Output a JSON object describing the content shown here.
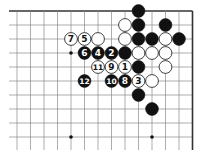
{
  "board": {
    "cols": 14,
    "rows": 10,
    "origin_x": 17,
    "origin_y": 11,
    "spacing_x": 13.5,
    "spacing_y": 14,
    "left_stub": 9,
    "bottom_extent": 150,
    "top_edge": true,
    "right_edge": true,
    "line_color": "#8a8a8a",
    "edge_color": "#333333"
  },
  "star_points": [
    {
      "col": 4,
      "row": 3
    },
    {
      "col": 4,
      "row": 9
    },
    {
      "col": 10,
      "row": 9
    }
  ],
  "stones": [
    {
      "col": 9,
      "row": 0,
      "color": "black",
      "label": ""
    },
    {
      "col": 8,
      "row": 1,
      "color": "white",
      "label": ""
    },
    {
      "col": 9,
      "row": 1,
      "color": "black",
      "label": ""
    },
    {
      "col": 11,
      "row": 1,
      "color": "black",
      "label": ""
    },
    {
      "col": 4,
      "row": 2,
      "color": "white",
      "label": "7"
    },
    {
      "col": 5,
      "row": 2,
      "color": "white",
      "label": "5"
    },
    {
      "col": 6,
      "row": 2,
      "color": "white",
      "label": ""
    },
    {
      "col": 8,
      "row": 2,
      "color": "white",
      "label": ""
    },
    {
      "col": 9,
      "row": 2,
      "color": "black",
      "label": ""
    },
    {
      "col": 10,
      "row": 2,
      "color": "black",
      "label": ""
    },
    {
      "col": 11,
      "row": 2,
      "color": "white",
      "label": ""
    },
    {
      "col": 12,
      "row": 2,
      "color": "black",
      "label": ""
    },
    {
      "col": 5,
      "row": 3,
      "color": "black",
      "label": "6"
    },
    {
      "col": 6,
      "row": 3,
      "color": "black",
      "label": "4"
    },
    {
      "col": 7,
      "row": 3,
      "color": "black",
      "label": "2"
    },
    {
      "col": 8,
      "row": 3,
      "color": "black",
      "label": ""
    },
    {
      "col": 9,
      "row": 3,
      "color": "white",
      "label": ""
    },
    {
      "col": 10,
      "row": 3,
      "color": "white",
      "label": ""
    },
    {
      "col": 11,
      "row": 3,
      "color": "white",
      "label": ""
    },
    {
      "col": 6,
      "row": 4,
      "color": "white",
      "label": "11"
    },
    {
      "col": 7,
      "row": 4,
      "color": "white",
      "label": "9"
    },
    {
      "col": 8,
      "row": 4,
      "color": "white",
      "label": "1"
    },
    {
      "col": 9,
      "row": 4,
      "color": "black",
      "label": ""
    },
    {
      "col": 11,
      "row": 4,
      "color": "white",
      "label": ""
    },
    {
      "col": 5,
      "row": 5,
      "color": "black",
      "label": "12"
    },
    {
      "col": 7,
      "row": 5,
      "color": "black",
      "label": "10"
    },
    {
      "col": 8,
      "row": 5,
      "color": "black",
      "label": "8"
    },
    {
      "col": 9,
      "row": 5,
      "color": "white",
      "label": "3"
    },
    {
      "col": 10,
      "row": 5,
      "color": "white",
      "label": ""
    },
    {
      "col": 9,
      "row": 6,
      "color": "black",
      "label": ""
    },
    {
      "col": 10,
      "row": 7,
      "color": "black",
      "label": ""
    }
  ]
}
